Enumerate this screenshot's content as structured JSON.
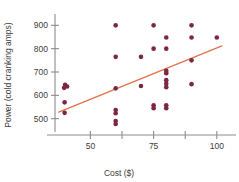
{
  "chart_data": {
    "type": "scatter",
    "title": "",
    "xlabel": "Cost ($)",
    "ylabel": "Power (cold cranking amps)",
    "xlim": [
      36,
      106
    ],
    "ylim": [
      460,
      940
    ],
    "x_ticks": [
      50,
      62.5,
      75,
      87.5,
      100
    ],
    "x_tick_labels": [
      "50",
      "",
      "75",
      "",
      "100"
    ],
    "y_ticks": [
      500,
      600,
      700,
      800,
      900
    ],
    "y_tick_labels": [
      "500",
      "600",
      "700",
      "800",
      "900"
    ],
    "grid": false,
    "legend": "none",
    "point_color": "#7B2840",
    "fit_line_color": "#E3704A",
    "axis_color": "#8C8C8C",
    "points": [
      {
        "x": 40,
        "y": 645
      },
      {
        "x": 40.8,
        "y": 638
      },
      {
        "x": 39.6,
        "y": 632
      },
      {
        "x": 39.8,
        "y": 570
      },
      {
        "x": 39.8,
        "y": 525
      },
      {
        "x": 60,
        "y": 900
      },
      {
        "x": 60,
        "y": 765
      },
      {
        "x": 60,
        "y": 630
      },
      {
        "x": 60,
        "y": 537
      },
      {
        "x": 60,
        "y": 523
      },
      {
        "x": 60,
        "y": 490
      },
      {
        "x": 60,
        "y": 477
      },
      {
        "x": 70,
        "y": 765
      },
      {
        "x": 70,
        "y": 640
      },
      {
        "x": 75,
        "y": 900
      },
      {
        "x": 75,
        "y": 800
      },
      {
        "x": 75,
        "y": 557
      },
      {
        "x": 75,
        "y": 545
      },
      {
        "x": 80,
        "y": 848
      },
      {
        "x": 80,
        "y": 800
      },
      {
        "x": 80,
        "y": 705
      },
      {
        "x": 80,
        "y": 695
      },
      {
        "x": 80,
        "y": 665
      },
      {
        "x": 80,
        "y": 650
      },
      {
        "x": 80,
        "y": 635
      },
      {
        "x": 80,
        "y": 557
      },
      {
        "x": 80,
        "y": 545
      },
      {
        "x": 90,
        "y": 900
      },
      {
        "x": 90,
        "y": 848
      },
      {
        "x": 90,
        "y": 750
      },
      {
        "x": 90,
        "y": 648
      },
      {
        "x": 100,
        "y": 848
      }
    ],
    "fit_line": {
      "x0": 37.5,
      "y0": 528,
      "x1": 102,
      "y1": 812
    }
  }
}
